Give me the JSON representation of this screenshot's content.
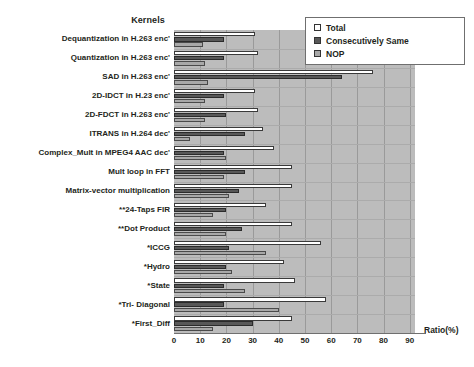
{
  "chart_data": {
    "type": "bar",
    "orientation": "horizontal",
    "title": "",
    "ylabel": "Kernels",
    "xlabel": "Ratio(%)",
    "xlim": [
      0,
      92
    ],
    "xticks": [
      0,
      10,
      20,
      30,
      40,
      50,
      60,
      70,
      80,
      90
    ],
    "grid": "vertical",
    "legend_position": "top-right",
    "categories": [
      "Dequantization in H.263 enc'",
      "Quantization in H.263 enc'",
      "SAD in H.263 enc'",
      "2D-IDCT in H.23 enc'",
      "2D-FDCT in H.263 enc'",
      "ITRANS  in H.264 dec'",
      "Complex_Mult  in MPEG4 AAC dec'",
      "Mult loop in FFT",
      "Matrix-vector multiplication",
      "**24-Taps FIR",
      "**Dot Product",
      "*ICCG",
      "*Hydro",
      "*State",
      "*Tri- Diagonal",
      "*First_Diff"
    ],
    "series": [
      {
        "name": "Total",
        "color": "#ffffff",
        "values": [
          31,
          32,
          76,
          31,
          32,
          34,
          38,
          45,
          45,
          35,
          45,
          56,
          42,
          46,
          58,
          45
        ]
      },
      {
        "name": "Consecutively Same",
        "color": "#585858",
        "values": [
          19,
          19,
          64,
          19,
          20,
          27,
          19,
          27,
          25,
          20,
          26,
          21,
          20,
          19,
          19,
          30
        ]
      },
      {
        "name": "NOP",
        "color": "#a8a8a8",
        "values": [
          11,
          12,
          13,
          12,
          12,
          6,
          20,
          19,
          21,
          15,
          20,
          35,
          22,
          27,
          40,
          15
        ]
      }
    ]
  },
  "legend": {
    "items": [
      {
        "label": "Total",
        "swatch": "total"
      },
      {
        "label": "Consecutively Same",
        "swatch": "cons"
      },
      {
        "label": "NOP",
        "swatch": "nop"
      }
    ]
  },
  "axis": {
    "y_title": "Kernels",
    "x_title": "Ratio(%)",
    "x_tick_labels": [
      "0",
      "10",
      "20",
      "30",
      "40",
      "50",
      "60",
      "70",
      "80",
      "90"
    ]
  }
}
